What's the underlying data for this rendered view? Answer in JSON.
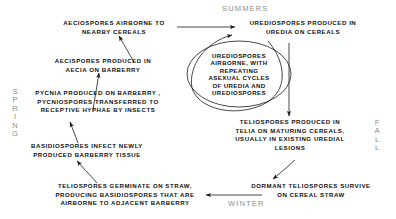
{
  "diagram": {
    "background": "#ffffff",
    "text_color": "#111111",
    "season_color": "#8d8d8d",
    "stroke_color": "#1a1a1a"
  },
  "seasons": [
    {
      "name": "summers",
      "label": "SUMMERS",
      "orientation": "horizontal"
    },
    {
      "name": "spring",
      "label": "S\nP\nR\nI\nN\nG",
      "orientation": "vertical"
    },
    {
      "name": "fall",
      "label": "F\nA\nL\nL",
      "orientation": "vertical"
    },
    {
      "name": "winter",
      "label": "WINTER",
      "orientation": "horizontal"
    }
  ],
  "nodes": [
    {
      "id": "aeciospores-airborne",
      "label": "AECIOSPORES AIRBORNE TO\nNEARBY CEREALS"
    },
    {
      "id": "aeciospores-produced",
      "label": "AECISPORES PRODUCED IN\nAECIA ON BARBERRY"
    },
    {
      "id": "pycnia-produced",
      "label": "PYCNIA PRODUCED ON BARBERRY ,\nPYCNIOSPORES TRANSFERRED TO\nRECEPTIVE HYPHAE BY INSECTS"
    },
    {
      "id": "basidiospores-infect",
      "label": "BASIDIOSPORES INFECT NEWLY\nPRODUCED BARBERRY TISSUE"
    },
    {
      "id": "teliospores-germinate",
      "label": "TELIOSPORES GERMINATE ON STRAW,\nPRODUCING BASIDIOSPORES THAT ARE\nAIRBORNE TO ADJACENT BARBERRY"
    },
    {
      "id": "dormant-teliospores",
      "label": "DORMANT TELIOSPORES SURVIVE\nON CEREAL STRAW"
    },
    {
      "id": "teliospores-produced",
      "label": "TELIOSPORES PRODUCED IN\nTELIA ON MATURING CEREALS,\nUSUALLY IN EXISTING UREDIAL\nLESIONS"
    },
    {
      "id": "urediospores-produced",
      "label": "UREDIOSPORES PRODUCED IN\nUREDIA ON CEREALS"
    }
  ],
  "cycle": {
    "id": "urediospores-cycle",
    "label": "UREDIOSPORES\nAIRBORNE, WITH\nREPEATING\nASEXUAL CYCLES\nOF UREDIA AND\nUREDIOSPORES"
  }
}
